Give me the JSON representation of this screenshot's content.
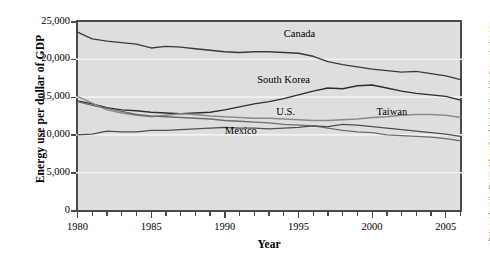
{
  "chart_data": {
    "type": "line",
    "title": "",
    "xlabel": "Year",
    "ylabel": "Energy use per dollar of GDP",
    "xlim": [
      1980,
      2006
    ],
    "ylim": [
      0,
      25000
    ],
    "ytick_labels": [
      "0",
      "5,000",
      "10,000",
      "15,000",
      "20,000",
      "25,000"
    ],
    "ytick_values": [
      0,
      5000,
      10000,
      15000,
      20000,
      25000
    ],
    "xtick_labels": [
      "1980",
      "1985",
      "1990",
      "1995",
      "2000",
      "2005"
    ],
    "xtick_values": [
      1980,
      1985,
      1990,
      1995,
      2000,
      2005
    ],
    "minor_xticks": true,
    "grid": "horizontal-white-gridlines",
    "legend_position": "inline-labels",
    "panel_background": "#dedede",
    "x": [
      1980,
      1981,
      1982,
      1983,
      1984,
      1985,
      1986,
      1987,
      1988,
      1989,
      1990,
      1991,
      1992,
      1993,
      1994,
      1995,
      1996,
      1997,
      1998,
      1999,
      2000,
      2001,
      2002,
      2003,
      2004,
      2005,
      2006
    ],
    "series": [
      {
        "name": "Canada",
        "color": "#3a3a3a",
        "values": [
          23600,
          22700,
          22400,
          22200,
          22000,
          21500,
          21700,
          21600,
          21400,
          21200,
          21000,
          20900,
          21000,
          21000,
          20900,
          20800,
          20400,
          19700,
          19300,
          19000,
          18700,
          18500,
          18300,
          18400,
          18100,
          17800,
          17300
        ]
      },
      {
        "name": "South Korea",
        "color": "#2e2e2e",
        "values": [
          14500,
          14100,
          13600,
          13300,
          13200,
          13000,
          12900,
          12800,
          12900,
          13000,
          13300,
          13700,
          14100,
          14400,
          14800,
          15300,
          15800,
          16200,
          16100,
          16500,
          16600,
          16200,
          15800,
          15500,
          15300,
          15100,
          14600
        ]
      },
      {
        "name": "Taiwan",
        "color": "#8a8a8a",
        "values": [
          15100,
          14200,
          13300,
          12900,
          12600,
          12400,
          12600,
          12800,
          12700,
          12500,
          12400,
          12300,
          12200,
          12200,
          12100,
          12000,
          11900,
          11900,
          12000,
          12100,
          12300,
          12400,
          12600,
          12700,
          12700,
          12600,
          12300
        ]
      },
      {
        "name": "U.S.",
        "color": "#6d6d6d",
        "values": [
          14400,
          13900,
          13500,
          13100,
          12700,
          12500,
          12400,
          12300,
          12200,
          12100,
          11900,
          11800,
          11700,
          11600,
          11400,
          11300,
          11200,
          10900,
          10600,
          10400,
          10300,
          10000,
          9900,
          9800,
          9700,
          9500,
          9200
        ]
      },
      {
        "name": "Mexico",
        "color": "#4f4f4f",
        "values": [
          10000,
          10100,
          10500,
          10400,
          10400,
          10600,
          10600,
          10700,
          10800,
          10900,
          11000,
          10900,
          10900,
          10800,
          10900,
          11000,
          11200,
          11100,
          11400,
          11300,
          11100,
          10900,
          10700,
          10500,
          10300,
          10100,
          9800
        ]
      }
    ],
    "annotations": [
      {
        "text": "Canada",
        "x": 1994,
        "y": 23200
      },
      {
        "text": "South Korea",
        "x": 1992.2,
        "y": 17100
      },
      {
        "text": "U.S.",
        "x": 1993.5,
        "y": 12900
      },
      {
        "text": "Taiwan",
        "x": 2000.3,
        "y": 12900
      },
      {
        "text": "Mexico",
        "x": 1990.0,
        "y": 10400
      }
    ]
  },
  "axes": {
    "y_title": "Energy use per dollar of GDP",
    "x_title": "Year"
  },
  "source_note": "Data are from the Energy Information Administration, http://www.eia.doe.gov"
}
